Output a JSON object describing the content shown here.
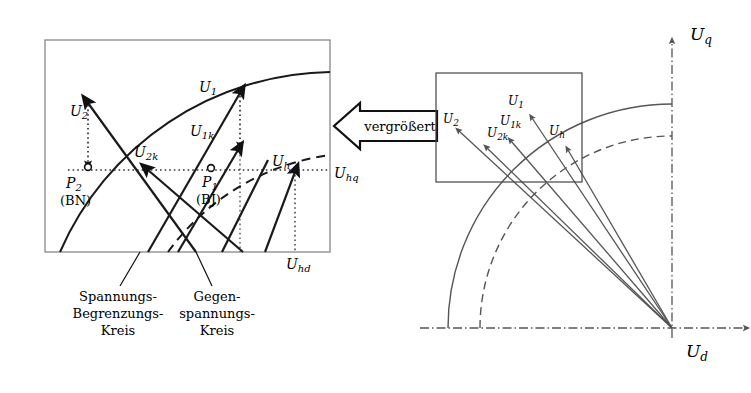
{
  "figure": {
    "kind": "vector-diagram",
    "background": "#ffffff",
    "line_color": "#1a1a1a",
    "axis_color": "#555555",
    "box_color": "#777777"
  },
  "callout": {
    "label": "vergrößert",
    "direction": "left"
  },
  "left_panel": {
    "frame": {
      "x": 45,
      "y": 40,
      "w": 285,
      "h": 212
    },
    "vectors": [
      {
        "name": "U_2",
        "label": "U",
        "sub": "2"
      },
      {
        "name": "U_2k",
        "label": "U",
        "sub": "2k"
      },
      {
        "name": "U_1",
        "label": "U",
        "sub": "1"
      },
      {
        "name": "U_1k",
        "label": "U",
        "sub": "1k"
      },
      {
        "name": "U_h",
        "label": "U",
        "sub": "h"
      }
    ],
    "points": [
      {
        "name": "P_2",
        "label": "P",
        "sub": "2",
        "note": "(BN)"
      },
      {
        "name": "P_1",
        "label": "P",
        "sub": "1",
        "note": "(BJ)"
      }
    ],
    "axis_labels": [
      {
        "name": "U_hq",
        "label": "U",
        "sub": "hq"
      },
      {
        "name": "U_hd",
        "label": "U",
        "sub": "hd"
      }
    ],
    "captions": [
      {
        "name": "voltage-limit-circle",
        "lines": [
          "Spannungs-",
          "Begrenzungs-",
          "Kreis"
        ]
      },
      {
        "name": "counter-voltage-circle",
        "lines": [
          "Gegen-",
          "spannungs-",
          "Kreis"
        ]
      }
    ]
  },
  "right_panel": {
    "inset_frame": {
      "x": 436,
      "y": 73,
      "w": 146,
      "h": 109
    },
    "origin": {
      "x": 672,
      "y": 328
    },
    "axes": [
      {
        "name": "U_q",
        "label": "U",
        "sub": "q",
        "orientation": "vertical"
      },
      {
        "name": "U_d",
        "label": "U",
        "sub": "d",
        "orientation": "horizontal"
      }
    ],
    "vectors": [
      {
        "name": "U_2",
        "label": "U",
        "sub": "2"
      },
      {
        "name": "U_2k",
        "label": "U",
        "sub": "2k"
      },
      {
        "name": "U_1k",
        "label": "U",
        "sub": "1k"
      },
      {
        "name": "U_1",
        "label": "U",
        "sub": "1"
      },
      {
        "name": "U_h",
        "label": "U",
        "sub": "h"
      }
    ],
    "arcs": [
      {
        "name": "voltage-limit-arc",
        "style": "solid"
      },
      {
        "name": "counter-voltage-arc",
        "style": "dashed"
      }
    ]
  }
}
